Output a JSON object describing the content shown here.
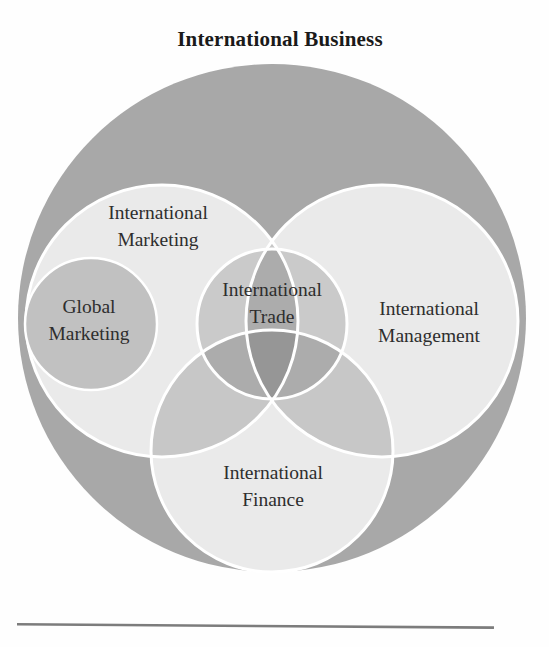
{
  "figure": {
    "title": "International Business",
    "circles": {
      "marketing": {
        "line1": "International",
        "line2": "Marketing"
      },
      "management": {
        "line1": "International",
        "line2": "Management"
      },
      "finance": {
        "line1": "International",
        "line2": "Finance"
      },
      "trade": {
        "line1": "International",
        "line2": "Trade"
      },
      "global_marketing": {
        "line1": "Global",
        "line2": "Marketing"
      }
    },
    "colors": {
      "outer_circle": "#a8a8a8",
      "field_circle": "#eaeaea",
      "overlap_two": "#c7c7c7",
      "overlap_three": "#adadad",
      "trade_shade": "rgba(0,0,0,0.135)",
      "global_circle": "#c1c1c1",
      "stroke": "#ffffff",
      "rule": "#7c7c7c",
      "title_text": "#1a1a1a",
      "label_text": "#2e2e2e"
    }
  }
}
